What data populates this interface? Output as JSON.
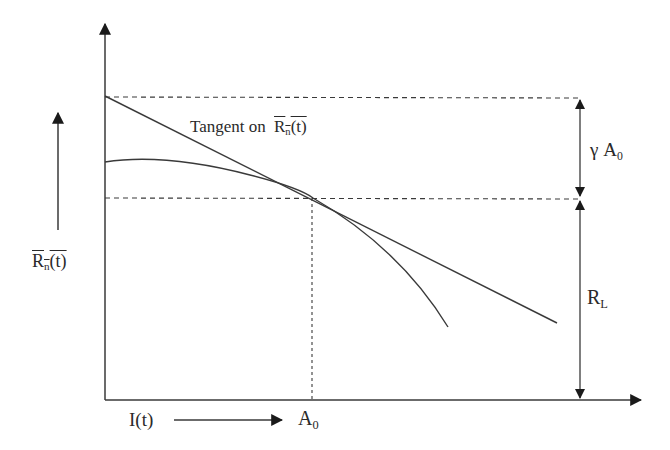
{
  "diagram": {
    "y_axis_label": {
      "main": "R",
      "sub": "n",
      "rest": "(t)",
      "overline": true
    },
    "x_axis_label": "I(t)",
    "x_marker_label": {
      "main": "A",
      "sub": "0"
    },
    "tangent_label": {
      "prefix": "Tangent on",
      "main": "R",
      "sub": "n",
      "rest": "(t)"
    },
    "gamma_label": {
      "main": "γ A",
      "sub": "0"
    },
    "rl_label": {
      "main": "R",
      "sub": "L"
    },
    "colors": {
      "line": "#3a3a3a",
      "text": "#2a2a2a",
      "background": "#ffffff"
    }
  }
}
